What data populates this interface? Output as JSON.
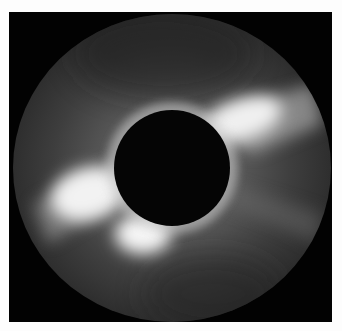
{
  "image": {
    "subject": "solar corona coronagraph image",
    "colors": {
      "background": "#fdfdfd",
      "frame": "#020202",
      "corona_base": "#3a3a3a",
      "streamer": "#f2f2f2",
      "occulter": "#050505"
    }
  }
}
